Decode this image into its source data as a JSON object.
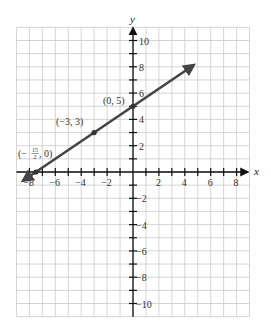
{
  "chart_data": {
    "type": "line",
    "title": "",
    "xlabel": "x",
    "ylabel": "y",
    "xlim": [
      -9,
      9
    ],
    "ylim": [
      -11,
      11
    ],
    "grid": true,
    "x_ticks": [
      -8,
      -6,
      -4,
      -2,
      2,
      4,
      6,
      8
    ],
    "x_tick_labels": [
      "−8",
      "−6",
      "−4",
      "−2",
      "2",
      "4",
      "6",
      "8"
    ],
    "y_ticks": [
      10,
      8,
      6,
      4,
      2,
      -2,
      -4,
      -6,
      -8,
      -10
    ],
    "y_tick_labels": [
      "10",
      "8",
      "6",
      "4",
      "2",
      "−2",
      "−4",
      "−6",
      "−8",
      "−10"
    ],
    "series": [
      {
        "name": "y = (2/3)x + 5",
        "slope": 0.6667,
        "intercept": 5,
        "x_start": -8.5,
        "x_end": 4.7,
        "arrows": "both",
        "color": "#444444"
      }
    ],
    "points": [
      {
        "x": -7.5,
        "y": 0,
        "label": "(−15/2, 0)"
      },
      {
        "x": -3,
        "y": 3,
        "label": "(−3, 3)"
      },
      {
        "x": 0,
        "y": 5,
        "label": "(0, 5)"
      }
    ]
  },
  "labels": {
    "x_axis": "x",
    "y_axis": "y",
    "point_0_prefix": "(−",
    "point_0_num": "15",
    "point_0_den": "2",
    "point_0_suffix": ", 0)",
    "point_1": "(−3, 3)",
    "point_2": "(0, 5)"
  }
}
